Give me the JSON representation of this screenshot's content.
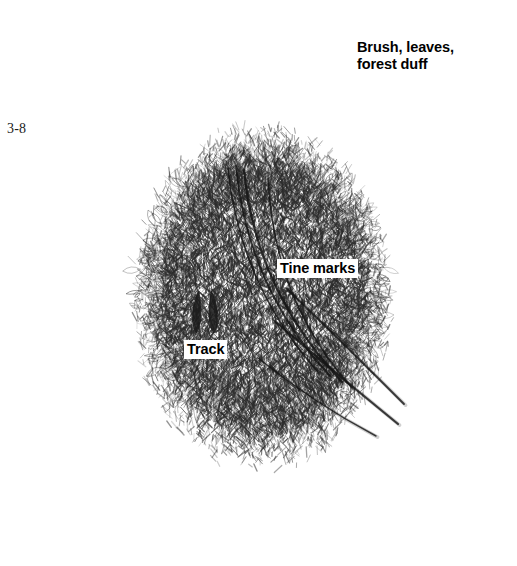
{
  "figure": {
    "number": "3-8",
    "medium": "graphite pencil drawing",
    "background_color": "#ffffff",
    "ink_color": "#2b2b2b"
  },
  "callouts": [
    {
      "id": "brush",
      "line1": "Brush, leaves,",
      "line2": "forest duff",
      "x": 354,
      "y": 38
    },
    {
      "id": "tine",
      "text": "Tine marks",
      "x": 277,
      "y": 259
    },
    {
      "id": "track",
      "text": "Track",
      "x": 184,
      "y": 340
    }
  ],
  "artwork": {
    "scrape_core": {
      "label": "raked bare earth oval",
      "center_x": 262,
      "center_y": 300,
      "radius_x": 132,
      "radius_y": 178,
      "tone": "dark dense scribble"
    },
    "debris_halo": {
      "label": "brush, leaves and forest duff pushed to the perimeter",
      "center_x": 262,
      "center_y": 290,
      "inner_radius_x": 120,
      "inner_radius_y": 168,
      "outer_radius_x": 248,
      "outer_radius_y": 282,
      "tone": "light scattered leaf strokes"
    },
    "tine_marks": {
      "label": "parallel rake furrows scored by antler tines",
      "count": 7,
      "paths": [
        [
          228,
          168,
          236,
          250,
          268,
          316,
          318,
          372
        ],
        [
          236,
          166,
          244,
          252,
          278,
          320,
          330,
          376
        ],
        [
          244,
          170,
          252,
          256,
          288,
          324,
          342,
          382
        ],
        [
          268,
          178,
          272,
          262,
          300,
          330,
          352,
          388
        ],
        [
          286,
          288,
          330,
          330,
          372,
          372,
          404,
          404
        ],
        [
          276,
          322,
          322,
          362,
          364,
          396,
          398,
          424
        ],
        [
          258,
          358,
          300,
          392,
          342,
          418,
          376,
          436
        ]
      ]
    },
    "track": {
      "label": "cloven deer hoof print",
      "x": 205,
      "y": 312,
      "width": 26,
      "height": 44,
      "tone": "solid dark"
    }
  }
}
